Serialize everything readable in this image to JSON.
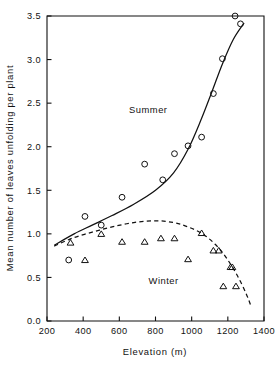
{
  "chart_data": {
    "type": "scatter",
    "title": "",
    "subtitle": "",
    "xlabel": "Elevation  (m)",
    "ylabel": "Mean number of leaves unfolding per plant",
    "xlim": [
      200,
      1400
    ],
    "ylim": [
      0.0,
      3.5
    ],
    "xticks": [
      200,
      400,
      600,
      800,
      1000,
      1200,
      1400
    ],
    "xtick_labels": [
      "200",
      "400",
      "600",
      "800",
      "1000",
      "1200",
      "1400"
    ],
    "yticks": [
      0.0,
      0.5,
      1.0,
      1.5,
      2.0,
      2.5,
      3.0,
      3.5
    ],
    "ytick_labels": [
      "0.0",
      "0.5",
      "1.0",
      "1.5",
      "2.0",
      "2.5",
      "3.0",
      "3.5"
    ],
    "grid": false,
    "legend_position": "inline-annotation",
    "annotations": [
      {
        "text": "Summer",
        "x": 760,
        "y": 2.39
      },
      {
        "text": "Winter",
        "x": 845,
        "y": 0.42
      }
    ],
    "series": [
      {
        "name": "Summer",
        "marker": "circle",
        "line_style": "solid",
        "points": [
          {
            "x": 320,
            "y": 0.7
          },
          {
            "x": 410,
            "y": 1.2
          },
          {
            "x": 500,
            "y": 1.1
          },
          {
            "x": 615,
            "y": 1.42
          },
          {
            "x": 740,
            "y": 1.8
          },
          {
            "x": 840,
            "y": 1.62
          },
          {
            "x": 905,
            "y": 1.92
          },
          {
            "x": 980,
            "y": 2.01
          },
          {
            "x": 1055,
            "y": 2.11
          },
          {
            "x": 1120,
            "y": 2.61
          },
          {
            "x": 1170,
            "y": 3.01
          },
          {
            "x": 1240,
            "y": 3.5
          },
          {
            "x": 1270,
            "y": 3.41
          }
        ],
        "fitted_curve": [
          {
            "x": 240,
            "y": 0.87
          },
          {
            "x": 350,
            "y": 1.0
          },
          {
            "x": 450,
            "y": 1.1
          },
          {
            "x": 560,
            "y": 1.21
          },
          {
            "x": 680,
            "y": 1.34
          },
          {
            "x": 800,
            "y": 1.5
          },
          {
            "x": 900,
            "y": 1.7
          },
          {
            "x": 980,
            "y": 1.97
          },
          {
            "x": 1050,
            "y": 2.3
          },
          {
            "x": 1110,
            "y": 2.62
          },
          {
            "x": 1170,
            "y": 2.95
          },
          {
            "x": 1230,
            "y": 3.23
          },
          {
            "x": 1290,
            "y": 3.42
          }
        ]
      },
      {
        "name": "Winter",
        "marker": "triangle",
        "line_style": "dashed",
        "points": [
          {
            "x": 330,
            "y": 0.9
          },
          {
            "x": 410,
            "y": 0.7
          },
          {
            "x": 500,
            "y": 1.0
          },
          {
            "x": 615,
            "y": 0.91
          },
          {
            "x": 740,
            "y": 0.91
          },
          {
            "x": 830,
            "y": 0.95
          },
          {
            "x": 905,
            "y": 0.95
          },
          {
            "x": 980,
            "y": 0.71
          },
          {
            "x": 1055,
            "y": 1.01
          },
          {
            "x": 1120,
            "y": 0.81
          },
          {
            "x": 1150,
            "y": 0.81
          },
          {
            "x": 1215,
            "y": 0.62
          },
          {
            "x": 1225,
            "y": 0.62
          },
          {
            "x": 1175,
            "y": 0.4
          },
          {
            "x": 1245,
            "y": 0.4
          }
        ],
        "fitted_curve": [
          {
            "x": 240,
            "y": 0.86
          },
          {
            "x": 340,
            "y": 0.95
          },
          {
            "x": 450,
            "y": 1.02
          },
          {
            "x": 560,
            "y": 1.08
          },
          {
            "x": 680,
            "y": 1.13
          },
          {
            "x": 800,
            "y": 1.15
          },
          {
            "x": 900,
            "y": 1.13
          },
          {
            "x": 980,
            "y": 1.08
          },
          {
            "x": 1060,
            "y": 1.0
          },
          {
            "x": 1130,
            "y": 0.88
          },
          {
            "x": 1190,
            "y": 0.73
          },
          {
            "x": 1250,
            "y": 0.53
          },
          {
            "x": 1300,
            "y": 0.32
          },
          {
            "x": 1330,
            "y": 0.16
          }
        ]
      }
    ],
    "colors": {
      "axis": "#111111",
      "summer_line": "#111111",
      "winter_line": "#111111",
      "background": "#ffffff"
    }
  }
}
